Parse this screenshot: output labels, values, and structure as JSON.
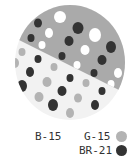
{
  "colors": {
    "background": "#ffffff",
    "light_field": "#f2f2f2",
    "gray_field": "#aaaaaa",
    "gray_dot": "#b3b3b3",
    "dark_dot": "#333333",
    "white_dot": "#ffffff"
  },
  "legend": {
    "items": [
      {
        "code": "B-15",
        "swatch": "none"
      },
      {
        "code": "G-15",
        "swatch": "gray-dot"
      },
      {
        "code": "BR-21",
        "swatch": "dark-dot"
      }
    ]
  },
  "swatch": {
    "shape": "circle",
    "regions": [
      {
        "name": "upper",
        "fill": "gray",
        "dots": [
          "dark",
          "white"
        ]
      },
      {
        "name": "lower",
        "fill": "light",
        "dots": [
          "dark",
          "gray"
        ]
      }
    ]
  }
}
